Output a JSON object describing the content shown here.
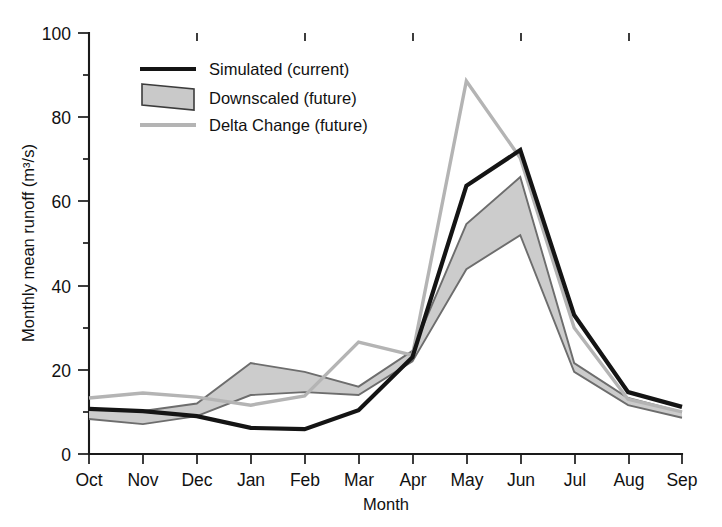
{
  "chart_data": {
    "type": "line",
    "title": "",
    "xlabel": "Month",
    "ylabel": "Monthly mean runoff (m³/s)",
    "categories": [
      "Oct",
      "Nov",
      "Dec",
      "Jan",
      "Feb",
      "Mar",
      "Apr",
      "May",
      "Jun",
      "Jul",
      "Aug",
      "Sep"
    ],
    "xlim": [
      0,
      11
    ],
    "ylim": [
      0,
      100
    ],
    "yticks": [
      0,
      20,
      40,
      60,
      80,
      100
    ],
    "ytick_labels": [
      "0",
      "20",
      "40",
      "60",
      "80",
      "100"
    ],
    "grid": false,
    "legend_position": "top-left-inside",
    "series": [
      {
        "name": "Simulated (current)",
        "style": "solid-black-thick",
        "color": "#141414",
        "values": [
          10.7,
          10.2,
          9.0,
          6.2,
          5.9,
          10.4,
          23.0,
          63.7,
          72.2,
          33.0,
          14.7,
          11.2
        ]
      },
      {
        "name": "Delta Change (future)",
        "style": "solid-lightgray",
        "color": "#b4b4b4",
        "values": [
          13.3,
          14.5,
          13.5,
          11.6,
          13.8,
          26.6,
          23.5,
          88.6,
          70.3,
          30.0,
          13.0,
          10.0
        ]
      },
      {
        "name": "Downscaled (future)",
        "style": "shaded-band",
        "color": "#c9c9c9",
        "band_upper": [
          10.7,
          10.2,
          12.0,
          21.6,
          19.5,
          16.0,
          24.5,
          54.6,
          65.8,
          21.6,
          13.3,
          10.0
        ],
        "band_lower": [
          8.3,
          7.1,
          9.0,
          14.0,
          14.7,
          14.0,
          22.0,
          43.9,
          52.0,
          19.5,
          11.6,
          8.6
        ]
      }
    ]
  },
  "legend": {
    "items": [
      {
        "label": "Simulated (current)",
        "swatch": "line-black"
      },
      {
        "label": "Downscaled (future)",
        "swatch": "band-gray"
      },
      {
        "label": "Delta Change (future)",
        "swatch": "line-lightgray"
      }
    ]
  },
  "axes": {
    "y_title": "Monthly mean runoff (m³/s)",
    "x_title": "Month",
    "y_labels": [
      "100",
      "80",
      "60",
      "40",
      "20",
      "0"
    ],
    "x_labels": [
      "Oct",
      "Nov",
      "Dec",
      "Jan",
      "Feb",
      "Mar",
      "Apr",
      "May",
      "Jun",
      "Jul",
      "Aug",
      "Sep"
    ]
  },
  "caption": {
    "text": ""
  }
}
